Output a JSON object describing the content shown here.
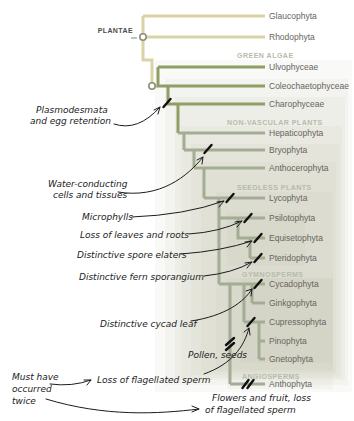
{
  "figure": {
    "type": "cladogram",
    "kingdom_label": "PLANTAE",
    "groups": [
      "GREEN ALGAE",
      "NON-VASCULAR PLANTS",
      "SEEDLESS PLANTS",
      "GYMNOSPERMS",
      "ANGIOSPERMS"
    ],
    "taxa": [
      "Glaucophyta",
      "Rhodophyta",
      "Ulvophyceae",
      "Coleochaetophyceae",
      "Charophyceae",
      "Hepaticophyta",
      "Bryophyta",
      "Anthocerophyta",
      "Lycophyta",
      "Psilotophyta",
      "Equisetophyta",
      "Pteridophyta",
      "Cycadophyta",
      "Ginkgophyta",
      "Cupressophyta",
      "Pinophyta",
      "Gnetophyta",
      "Anthophyta"
    ],
    "annotations": {
      "plasmodesmata": [
        "Plasmodesmata",
        "and egg retention"
      ],
      "water_conducting": [
        "Water-conducting",
        "cells and tissues"
      ],
      "microphylls": [
        "Microphylls"
      ],
      "loss_leaves_roots": [
        "Loss of leaves and roots"
      ],
      "spore_elaters": [
        "Distinctive spore elaters"
      ],
      "fern_sporangium": [
        "Distinctive fern sporangium"
      ],
      "cycad_leaf": [
        "Distinctive cycad leaf"
      ],
      "pollen_seeds": [
        "Pollen, seeds"
      ],
      "loss_flagellated_sperm": [
        "Loss of flagellated sperm"
      ],
      "must_have_twice": [
        "Must have",
        "occurred",
        "twice"
      ],
      "flowers_fruit": [
        "Flowers and fruit, loss",
        "of flagellated sperm"
      ]
    },
    "colors": {
      "basal_branch": "#d9d3a6",
      "green_algae_branch": "#8f9e66",
      "land_plant_branch": "#a3ac94",
      "node_circle_stroke": "#8a8f7a",
      "group_label": "#b5bcab",
      "taxon_label": "#666560",
      "annotation_text": "#1c1c1c",
      "tick_mark": "#101010",
      "shading": "#aeb894"
    }
  }
}
